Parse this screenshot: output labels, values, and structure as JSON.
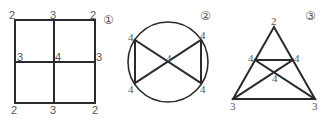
{
  "figures": [
    {
      "label": "①",
      "shape": "2x2 grid of squares",
      "vertex_degrees": {
        "top_left": "2",
        "top_mid": "3",
        "top_right": "2",
        "mid_left": "3",
        "center": "4",
        "mid_right": "3",
        "bottom_left": "2",
        "bottom_mid": "3",
        "bottom_right": "2"
      }
    },
    {
      "label": "②",
      "shape": "circle with inscribed bowtie",
      "vertex_degrees": {
        "top_left": "4",
        "top_right": "4",
        "center": "4",
        "bottom_left": "4",
        "bottom_right": "4"
      }
    },
    {
      "label": "③",
      "shape": "triangle with inner crossing lines",
      "vertex_degrees": {
        "apex": "2",
        "inner_left": "4",
        "inner_right": "4",
        "crossing": "4",
        "bottom_left": "3",
        "bottom_right": "3"
      }
    }
  ],
  "colors": {
    "line": "#2a2a2a",
    "label": "#555555",
    "background": "#ffffff"
  }
}
